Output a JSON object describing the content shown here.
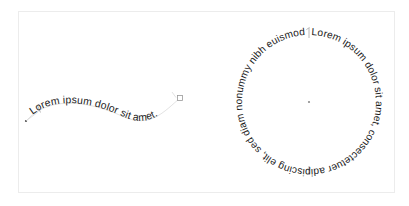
{
  "canvas": {
    "background_color": "#ffffff",
    "frame_color": "#ececec",
    "width": 409,
    "height": 206
  },
  "objects": {
    "curve_text": {
      "name": "Text on S-curve path",
      "content": "Lorem ipsum dolor sit amet.",
      "text_color": "#1b1b1b",
      "path_color": "#b9b9b9",
      "start_marker": "text-start-tick",
      "end_marker": "path-end-handle"
    },
    "circle_text": {
      "name": "Text on circular path",
      "content": "Lorem ipsum dolor sit amet, consectetuer adipiscing elit, sed diam nonummy nibh euismod tincidunt",
      "text_color": "#1b1b1b",
      "center_dot_color": "#8d8d8d",
      "start_marker": "text-start-tick",
      "radius": 67,
      "center_x": 309,
      "center_y": 102
    }
  }
}
